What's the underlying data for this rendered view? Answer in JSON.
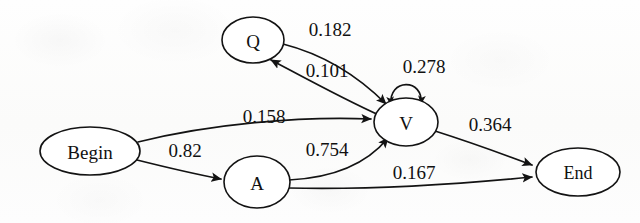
{
  "diagram": {
    "type": "directed-graph",
    "background_color": "#fcfcfb",
    "stroke_color": "#131313",
    "node_fill": "#ffffff",
    "nodes": [
      {
        "id": "begin",
        "label": "Begin",
        "cx": 90,
        "cy": 151,
        "rx": 50,
        "ry": 24
      },
      {
        "id": "q",
        "label": "Q",
        "cx": 253,
        "cy": 40,
        "rx": 31,
        "ry": 23
      },
      {
        "id": "a",
        "label": "A",
        "cx": 257,
        "cy": 182,
        "rx": 33,
        "ry": 26
      },
      {
        "id": "v",
        "label": "V",
        "cx": 406,
        "cy": 122,
        "rx": 32,
        "ry": 24
      },
      {
        "id": "end",
        "label": "End",
        "cx": 578,
        "cy": 172,
        "rx": 42,
        "ry": 24
      }
    ],
    "edges": [
      {
        "id": "q-to-v",
        "from": "Q",
        "to": "V",
        "weight": "0.182",
        "label_x": 330,
        "label_y": 29
      },
      {
        "id": "v-to-q",
        "from": "V",
        "to": "Q",
        "weight": "0.101",
        "label_x": 327,
        "label_y": 70
      },
      {
        "id": "v-to-v",
        "from": "V",
        "to": "V",
        "weight": "0.278",
        "label_x": 424,
        "label_y": 66
      },
      {
        "id": "begin-to-v",
        "from": "Begin",
        "to": "V",
        "weight": "0.158",
        "label_x": 264,
        "label_y": 116
      },
      {
        "id": "begin-to-a",
        "from": "Begin",
        "to": "A",
        "weight": "0.82",
        "label_x": 185,
        "label_y": 150
      },
      {
        "id": "a-to-v",
        "from": "A",
        "to": "V",
        "weight": "0.754",
        "label_x": 327,
        "label_y": 149
      },
      {
        "id": "a-to-end",
        "from": "A",
        "to": "End",
        "weight": "0.167",
        "label_x": 414,
        "label_y": 172
      },
      {
        "id": "v-to-end",
        "from": "V",
        "to": "End",
        "weight": "0.364",
        "label_x": 490,
        "label_y": 124
      }
    ]
  }
}
